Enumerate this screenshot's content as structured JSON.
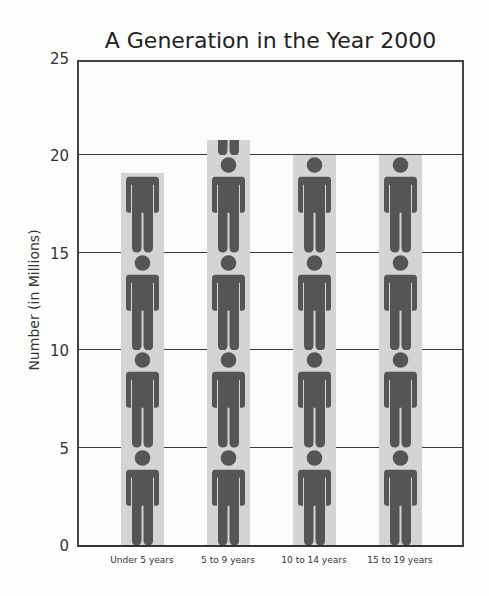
{
  "chart_data": {
    "type": "bar",
    "subtype": "pictograph",
    "title": "A Generation in the Year 2000",
    "xlabel": "",
    "ylabel": "Number (in Millions)",
    "categories": [
      "Under 5 years",
      "5 to 9 years",
      "10 to 14 years",
      "15 to 19 years"
    ],
    "values": [
      19.1,
      20.8,
      20.0,
      20.0
    ],
    "ylim": [
      0,
      25
    ],
    "yticks": [
      "0",
      "5",
      "10",
      "15",
      "20",
      "25"
    ],
    "grid": true,
    "legend": null,
    "icon": "person-icon",
    "icon_unit": 5,
    "colors": {
      "icon": "#555555",
      "bar_bg": "#d4d4d4",
      "grid": "#3a3a3a"
    }
  }
}
